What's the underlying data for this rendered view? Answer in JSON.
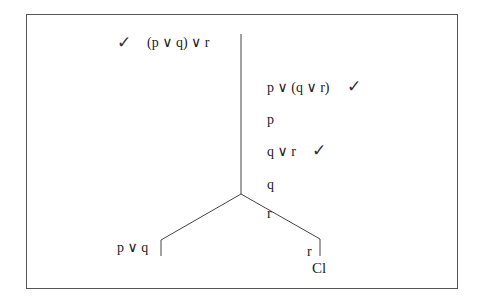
{
  "diagram": {
    "type": "truth-tree",
    "premise": {
      "formula": "(p ∨ q) ∨ r",
      "checked": true,
      "check_mark": "✓"
    },
    "trunk": [
      {
        "formula": "p ∨ (q ∨ r)",
        "checked": true,
        "check_mark": "✓"
      },
      {
        "formula": "p"
      },
      {
        "formula": "q ∨ r",
        "checked": true,
        "check_mark": "✓"
      },
      {
        "formula": "q"
      },
      {
        "formula": "r"
      }
    ],
    "branches": [
      {
        "formula": "p ∨ q",
        "closed": false
      },
      {
        "formula": "r",
        "closed": true,
        "closure_label": "Cl"
      }
    ]
  }
}
